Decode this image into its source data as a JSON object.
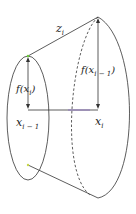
{
  "diagram": {
    "labels": {
      "slant": {
        "base": "z",
        "sub": "i"
      },
      "radius_small": {
        "pre": "f(x",
        "sub": "i",
        "post": ")"
      },
      "radius_large": {
        "pre": "f(x",
        "sub": "i − 1",
        "post": ")"
      },
      "x_left": {
        "base": "x",
        "sub": "i − 1"
      },
      "x_right": {
        "base": "x",
        "sub": "i"
      }
    },
    "colors": {
      "stroke": "#333333",
      "accent_green": "#6ccf3a",
      "accent_purple": "#8a6fc0"
    }
  }
}
